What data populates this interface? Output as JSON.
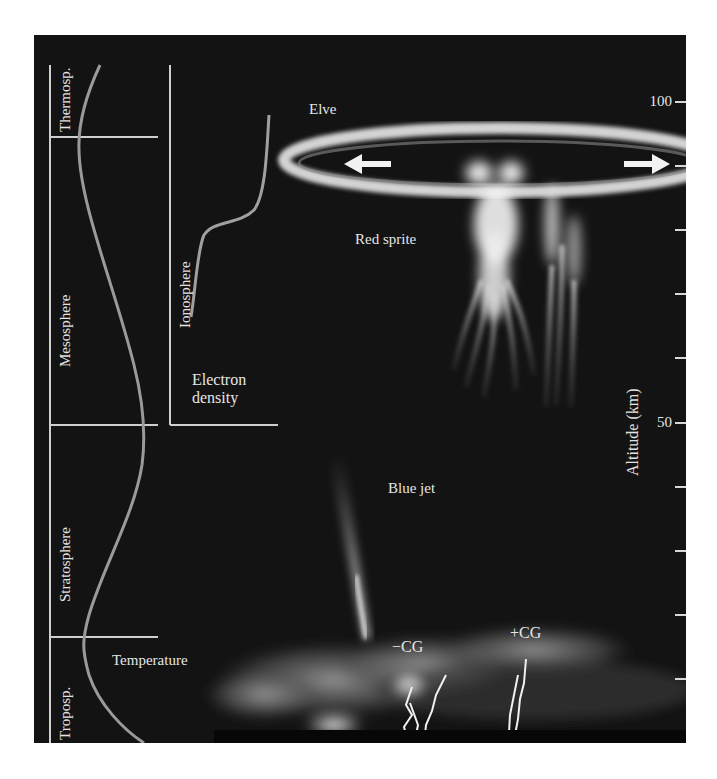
{
  "figure": {
    "background": "#131313",
    "line_color": "#d8d8d8",
    "curve_color": "#9a9a9a"
  },
  "layers": [
    {
      "name": "Thermosp.",
      "alt_bottom_km": 90,
      "alt_top_km": 100
    },
    {
      "name": "Mesosphere",
      "alt_bottom_km": 50,
      "alt_top_km": 90
    },
    {
      "name": "Stratosphere",
      "alt_bottom_km": 15,
      "alt_top_km": 50
    },
    {
      "name": "Troposp.",
      "alt_bottom_km": 0,
      "alt_top_km": 15
    }
  ],
  "labels": {
    "thermosphere": "Thermosp.",
    "mesosphere": "Mesosphere",
    "stratosphere": "Stratosphere",
    "troposphere": "Troposp.",
    "ionosphere": "Ionosphere",
    "electron_density_line1": "Electron",
    "electron_density_line2": "density",
    "temperature": "Temperature",
    "elve": "Elve",
    "red_sprite": "Red sprite",
    "blue_jet": "Blue jet",
    "neg_cg": "−CG",
    "pos_cg": "+CG"
  },
  "axis": {
    "title": "Altitude (km)",
    "tick_labels": [
      {
        "value": 100,
        "text": "100"
      },
      {
        "value": 50,
        "text": "50"
      }
    ],
    "ticks_km": [
      100,
      90,
      80,
      70,
      60,
      50,
      40,
      30,
      20,
      10
    ]
  },
  "curves": {
    "temperature": "Temperature profile vs altitude (min at tropopause ~15 km, max at stratopause ~50 km, min at mesopause ~90 km)",
    "electron_density": "Electron density profile increasing with altitude, sharp rise near 85-90 km"
  },
  "phenomena": [
    {
      "name": "Elve",
      "description": "expanding ring near 90-95 km with outward arrows"
    },
    {
      "name": "Red sprite",
      "description": "jellyfish-shaped discharge 50-90 km"
    },
    {
      "name": "Blue jet",
      "description": "upward cone from cloud top to ~45 km"
    },
    {
      "name": "-CG",
      "description": "negative cloud-to-ground lightning"
    },
    {
      "name": "+CG",
      "description": "positive cloud-to-ground lightning"
    }
  ]
}
